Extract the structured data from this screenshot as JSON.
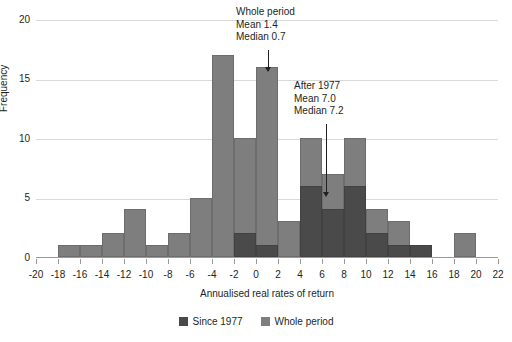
{
  "chart_data": {
    "type": "bar",
    "title": "",
    "xlabel": "Annualised real rates of return",
    "ylabel": "Frequency",
    "xlim": [
      -20,
      22
    ],
    "ylim": [
      0,
      20
    ],
    "xticks": [
      "-20",
      "-18",
      "-16",
      "-14",
      "-12",
      "-10",
      "-8",
      "-6",
      "-4",
      "-2",
      "0",
      "2",
      "4",
      "6",
      "8",
      "10",
      "12",
      "14",
      "16",
      "18",
      "20",
      "22"
    ],
    "yticks": [
      "0",
      "5",
      "10",
      "15",
      "20"
    ],
    "grid": true,
    "bin_width": 2,
    "bin_starts": [
      -18,
      -16,
      -14,
      -12,
      -10,
      -8,
      -6,
      -4,
      -2,
      0,
      2,
      4,
      6,
      8,
      10,
      12,
      14,
      18
    ],
    "bin_labels": [
      "-18 to -16",
      "-16 to -14",
      "-14 to -12",
      "-12 to -10",
      "-10 to -8",
      "-8 to -6",
      "-6 to -4",
      "-4 to -2",
      "-2 to 0",
      "0 to 2",
      "2 to 4",
      "4 to 6",
      "6 to 8",
      "8 to 10",
      "10 to 12",
      "12 to 14",
      "14 to 16",
      "18 to 20"
    ],
    "series": [
      {
        "name": "Whole period",
        "color": "#7e7e7e",
        "values": [
          1,
          1,
          2,
          4,
          1,
          2,
          5,
          17,
          10,
          16,
          3,
          10,
          7,
          10,
          4,
          3,
          1,
          2
        ]
      },
      {
        "name": "Since 1977",
        "color": "#4a4a4a",
        "values": [
          0,
          0,
          0,
          0,
          0,
          0,
          0,
          0,
          2,
          1,
          0,
          6,
          4,
          6,
          2,
          1,
          1,
          0
        ]
      }
    ],
    "legend": [
      "Since 1977",
      "Whole period"
    ],
    "legend_position": "bottom",
    "annotations": [
      {
        "id": "whole-period",
        "lines": [
          "Whole period",
          "Mean 1.4",
          "Median 0.7"
        ],
        "points_to_x": 1,
        "points_to_y": 16
      },
      {
        "id": "after-1977",
        "lines": [
          "After 1977",
          "Mean 7.0",
          "Median 7.2"
        ],
        "points_to_x": 7,
        "points_to_y": 4
      }
    ]
  }
}
